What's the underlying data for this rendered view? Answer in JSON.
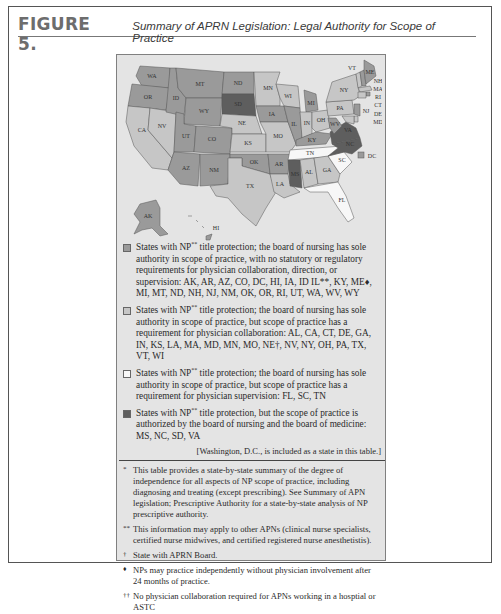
{
  "figure": {
    "label": "FIGURE 5.",
    "title": "Summary of APRN Legislation: Legal Authority for Scope of Practice"
  },
  "colors": {
    "full_authority": "#9a9a9a",
    "collaboration": "#c6c6c6",
    "supervision": "#f7f7f7",
    "joint_boards": "#5e5e5e",
    "background": "#e4e4e4"
  },
  "map": {
    "labels": {
      "WA": "WA",
      "OR": "OR",
      "CA": "CA",
      "NV": "NV",
      "ID": "ID",
      "MT": "MT",
      "WY": "WY",
      "UT": "UT",
      "CO": "CO",
      "AZ": "AZ",
      "NM": "NM",
      "ND": "ND",
      "SD": "SD",
      "NE": "NE",
      "KS": "KS",
      "OK": "OK",
      "TX": "TX",
      "MN": "MN",
      "IA": "IA",
      "MO": "MO",
      "AR": "AR",
      "LA": "LA",
      "WI": "WI",
      "IL": "IL",
      "MS": "MS",
      "MI": "MI",
      "IN": "IN",
      "KY": "KY",
      "TN": "TN",
      "AL": "AL",
      "OH": "OH",
      "GA": "GA",
      "FL": "FL",
      "SC": "SC",
      "NC": "NC",
      "VA": "VA",
      "WV": "WV",
      "PA": "PA",
      "NY": "NY",
      "VT": "VT",
      "ME": "ME",
      "NH": "NH",
      "MA": "MA",
      "RI": "RI",
      "CT": "CT",
      "NJ": "NJ",
      "DE": "DE",
      "MD": "MD",
      "AK": "AK",
      "HI": "HI",
      "DC": "DC"
    }
  },
  "legend": [
    {
      "category": "full_authority",
      "text_pre": "States with NP",
      "sup": "**",
      "text": "title protection; the board of nursing has sole authority in scope of practice, with no statutory or regulatory requirements for physician collaboration, direction, or supervision: AK, AR, AZ, CO, DC, HI, IA, ID IL**, KY, ME♦, MI, MT, ND, NH, NJ, NM, OK, OR, RI, UT, WA, WV, WY"
    },
    {
      "category": "collaboration",
      "text_pre": "States with NP",
      "sup": "**",
      "text": "title protection; the board of nursing has sole authority in scope of practice, but scope of practice has a requirement for physician collaboration: AL, CA, CT, DE, GA, IN, KS, LA, MA, MD, MN, MO, NE†, NV, NY, OH, PA, TX, VT, WI"
    },
    {
      "category": "supervision",
      "text_pre": "States with NP",
      "sup": "**",
      "text": "title protection; the board of nursing has sole authority in scope of practice, but scope of practice has a requirement for physician supervision: FL, SC, TN"
    },
    {
      "category": "joint_boards",
      "text_pre": "States with NP",
      "sup": "**",
      "text": "title protection, but the scope of practice is authorized by the board of nursing and the board of medicine: MS, NC, SD, VA"
    }
  ],
  "dc_note": "[Washington, D.C., is included as a state in this table.]",
  "footnotes": [
    {
      "mark": "*",
      "text": "This table provides a state-by-state summary of the degree of independence for all aspects of NP scope of practice, including diagnosing and treating (except prescribing). See Summary of APN legislation; Prescriptive Authority for a state-by-state analysis of NP prescriptive authority."
    },
    {
      "mark": "**",
      "text": "This information may apply to other APNs (clinical nurse specialists, certified nurse midwives, and certified registered nurse anesthetistis)."
    },
    {
      "mark": "†",
      "text": "State with APRN Board."
    },
    {
      "mark": "♦",
      "text": "NPs may practice independently without physician involvement after 24 months of practice."
    },
    {
      "mark": "††",
      "text": "No physician collaboration required for APNs working in a hosptial or ASTC"
    }
  ]
}
